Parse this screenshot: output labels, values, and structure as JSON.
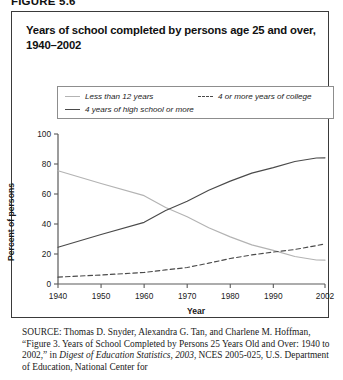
{
  "figure_label": "FIGURE 5.6",
  "title": "Years of school completed by persons age 25 and over, 1940–2002",
  "legend": {
    "items": [
      {
        "label": "Less than 12 years",
        "style": "solid-light",
        "color": "#b3b3b3"
      },
      {
        "label": "4 years of high school or more",
        "style": "solid-dark",
        "color": "#4a4a4a"
      },
      {
        "label": "4 or more years of college",
        "style": "dashed",
        "color": "#4a4a4a"
      }
    ]
  },
  "source": {
    "label": "SOURCE:",
    "line1": " Thomas D. Snyder, Alexandra G. Tan, and Charlene M. Hoffman, “Figure 3. Years of School Completed by Persons 25 Years Old and Over: 1940 to 2002,” in ",
    "italic1": "Digest of Education Statistics, 2003",
    "line2": ", NCES 2005-025, U.S. Department of Education, National Center for"
  },
  "chart_data": {
    "type": "line",
    "title": "Years of school completed by persons age 25 and over, 1940–2002",
    "xlabel": "Year",
    "ylabel": "Percent of persons",
    "xlim": [
      1940,
      2002
    ],
    "ylim": [
      0,
      100
    ],
    "xticks": [
      1940,
      1950,
      1960,
      1970,
      1980,
      1990,
      2002
    ],
    "yticks": [
      0,
      20,
      40,
      60,
      80,
      100
    ],
    "grid": false,
    "legend_position": "top",
    "series": [
      {
        "name": "Less than 12 years",
        "color": "#b3b3b3",
        "dash": false,
        "x": [
          1940,
          1950,
          1960,
          1965,
          1970,
          1975,
          1980,
          1985,
          1990,
          1995,
          2000,
          2002
        ],
        "values": [
          75.5,
          67.0,
          58.9,
          51.0,
          44.8,
          37.5,
          31.4,
          26.1,
          22.4,
          18.3,
          16.0,
          15.9
        ]
      },
      {
        "name": "4 years of high school or more",
        "color": "#4a4a4a",
        "dash": false,
        "x": [
          1940,
          1950,
          1960,
          1965,
          1970,
          1975,
          1980,
          1985,
          1990,
          1995,
          2000,
          2002
        ],
        "values": [
          24.5,
          33.0,
          41.1,
          49.0,
          55.2,
          62.5,
          68.6,
          73.9,
          77.6,
          81.7,
          84.0,
          84.1
        ]
      },
      {
        "name": "4 or more years of college",
        "color": "#4a4a4a",
        "dash": true,
        "x": [
          1940,
          1950,
          1960,
          1965,
          1970,
          1975,
          1980,
          1985,
          1990,
          1995,
          2000,
          2002
        ],
        "values": [
          4.6,
          6.0,
          7.7,
          9.4,
          11.0,
          13.9,
          17.0,
          19.4,
          21.3,
          23.0,
          25.6,
          26.7
        ]
      }
    ]
  }
}
